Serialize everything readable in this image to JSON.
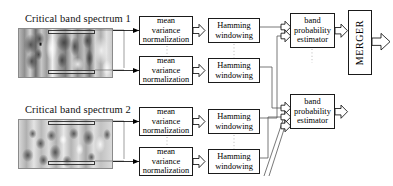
{
  "diagram": {
    "accent_color": "#000000",
    "box_border_color": "#1a1a1a",
    "background": "#ffffff"
  },
  "spectra": [
    {
      "label": "Critical band spectrum 1",
      "id": "critical-band-spectrum-1"
    },
    {
      "label": "Critical band spectrum 2",
      "id": "critical-band-spectrum-2"
    }
  ],
  "stages": {
    "normalization": {
      "label_line_1": "mean",
      "label_line_2": "variance",
      "label_line_3": "normalization"
    },
    "windowing": {
      "label_line_1": "Hamming",
      "label_line_2": "windowing"
    },
    "estimator": {
      "label_line_1": "band",
      "label_line_2": "probability",
      "label_line_3": "estimator"
    },
    "merger": {
      "label": "MERGER"
    }
  },
  "blocks": [
    {
      "name": "mean-variance-normalization-1",
      "stage": "normalization",
      "row": 1
    },
    {
      "name": "mean-variance-normalization-2",
      "stage": "normalization",
      "row": 2
    },
    {
      "name": "mean-variance-normalization-3",
      "stage": "normalization",
      "row": 3
    },
    {
      "name": "mean-variance-normalization-4",
      "stage": "normalization",
      "row": 4
    },
    {
      "name": "hamming-windowing-1",
      "stage": "windowing",
      "row": 1
    },
    {
      "name": "hamming-windowing-2",
      "stage": "windowing",
      "row": 2
    },
    {
      "name": "hamming-windowing-3",
      "stage": "windowing",
      "row": 3
    },
    {
      "name": "hamming-windowing-4",
      "stage": "windowing",
      "row": 4
    },
    {
      "name": "band-probability-estimator-1",
      "stage": "estimator",
      "row": 1
    },
    {
      "name": "band-probability-estimator-2",
      "stage": "estimator",
      "row": 2
    },
    {
      "name": "merger",
      "stage": "merger",
      "row": 0
    }
  ],
  "flow": {
    "output_arrow": "output-arrow",
    "arrow_style": "hollow-block-arrow"
  }
}
